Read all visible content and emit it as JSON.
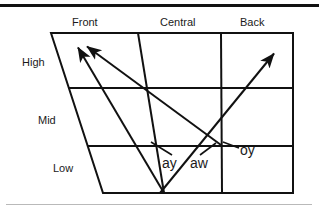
{
  "figure": {
    "type": "vowel-chart",
    "stroke_color": "#111111",
    "background_color": "#ffffff",
    "top_rule_color": "#111111",
    "bottom_rule_color": "#b9b9b9",
    "column_labels": [
      {
        "id": "front",
        "text": "Front"
      },
      {
        "id": "central",
        "text": "Central"
      },
      {
        "id": "back",
        "text": "Back"
      }
    ],
    "row_labels": [
      {
        "id": "high",
        "text": "High"
      },
      {
        "id": "mid",
        "text": "Mid"
      },
      {
        "id": "low",
        "text": "Low"
      }
    ],
    "diphthongs": [
      {
        "id": "ay",
        "text": "ay"
      },
      {
        "id": "aw",
        "text": "aw"
      },
      {
        "id": "oy",
        "text": "oy"
      }
    ],
    "arrows": [
      {
        "id": "ay-arrow",
        "label": "ay",
        "from_x": 164,
        "from_y": 193,
        "to_x": 76,
        "to_y": 46,
        "direction": "low-central to high-front"
      },
      {
        "id": "aw-arrow",
        "label": "aw",
        "from_x": 221,
        "from_y": 145,
        "to_x": 85,
        "to_y": 45,
        "direction": "mid-back to high-front"
      },
      {
        "id": "oy-arrow",
        "label": "oy",
        "from_x": 160,
        "from_y": 193,
        "to_x": 276,
        "to_y": 52,
        "direction": "low-central to high-back"
      }
    ],
    "leader_lines": [
      {
        "id": "ay-leader",
        "from_x": 172,
        "from_y": 156,
        "to_x": 150,
        "to_y": 143
      },
      {
        "id": "aw-leader",
        "from_x": 199,
        "from_y": 156,
        "to_x": 216,
        "to_y": 143
      },
      {
        "id": "oy-leader",
        "from_x": 240,
        "from_y": 148,
        "to_x": 224,
        "to_y": 142
      }
    ]
  }
}
